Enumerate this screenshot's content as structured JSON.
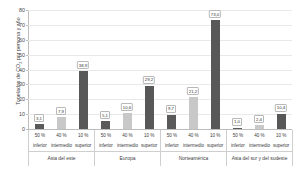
{
  "chart_data": {
    "type": "bar",
    "title": "",
    "xlabel": "",
    "ylabel": "Toneladas de CO2 por persona y año",
    "ylabel_prefix": "Toneladas de CO",
    "ylabel_sub": "2",
    "ylabel_suffix": " por persona y año",
    "ylim": [
      0,
      80
    ],
    "yticks": [
      0,
      10,
      20,
      30,
      40,
      50,
      60,
      70,
      80
    ],
    "grid": true,
    "legend": "none",
    "categories": [
      "50 %\ninferior",
      "40 %\nintermedio",
      "10 %\nsuperior"
    ],
    "groups": [
      {
        "name": "Asia del este",
        "bars": [
          {
            "category_pct": "50 %",
            "category_name": "inferior",
            "value": 3.1,
            "label": "3,1",
            "color": "#5a5a5a"
          },
          {
            "category_pct": "40 %",
            "category_name": "intermedio",
            "value": 7.9,
            "label": "7,9",
            "color": "#c8c8c8"
          },
          {
            "category_pct": "10 %",
            "category_name": "superior",
            "value": 38.9,
            "label": "38,9",
            "color": "#585858"
          }
        ]
      },
      {
        "name": "Europa",
        "bars": [
          {
            "category_pct": "50 %",
            "category_name": "inferior",
            "value": 5.1,
            "label": "5,1",
            "color": "#5a5a5a"
          },
          {
            "category_pct": "40 %",
            "category_name": "intermedio",
            "value": 10.6,
            "label": "10,6",
            "color": "#c8c8c8"
          },
          {
            "category_pct": "10 %",
            "category_name": "superior",
            "value": 29.2,
            "label": "29,2",
            "color": "#585858"
          }
        ]
      },
      {
        "name": "Norteamérica",
        "bars": [
          {
            "category_pct": "50 %",
            "category_name": "inferior",
            "value": 9.7,
            "label": "9,7",
            "color": "#5a5a5a"
          },
          {
            "category_pct": "40 %",
            "category_name": "intermedio",
            "value": 21.2,
            "label": "21,2",
            "color": "#c8c8c8"
          },
          {
            "category_pct": "10 %",
            "category_name": "superior",
            "value": 73.0,
            "label": "73,0",
            "color": "#585858"
          }
        ]
      },
      {
        "name": "Asia del sur y del sudeste",
        "bars": [
          {
            "category_pct": "50 %",
            "category_name": "inferior",
            "value": 1.0,
            "label": "1,0",
            "color": "#5a5a5a"
          },
          {
            "category_pct": "40 %",
            "category_name": "intermedio",
            "value": 2.4,
            "label": "2,4",
            "color": "#c8c8c8"
          },
          {
            "category_pct": "10 %",
            "category_name": "superior",
            "value": 10.4,
            "label": "10,4",
            "color": "#585858"
          }
        ]
      }
    ]
  },
  "colors": {
    "background": "#ffffff",
    "gridline": "#e9e9e9",
    "axis": "#bdbdbd",
    "text": "#3d3d3d",
    "bar_low": "#5a5a5a",
    "bar_mid": "#c8c8c8",
    "bar_high": "#585858"
  }
}
